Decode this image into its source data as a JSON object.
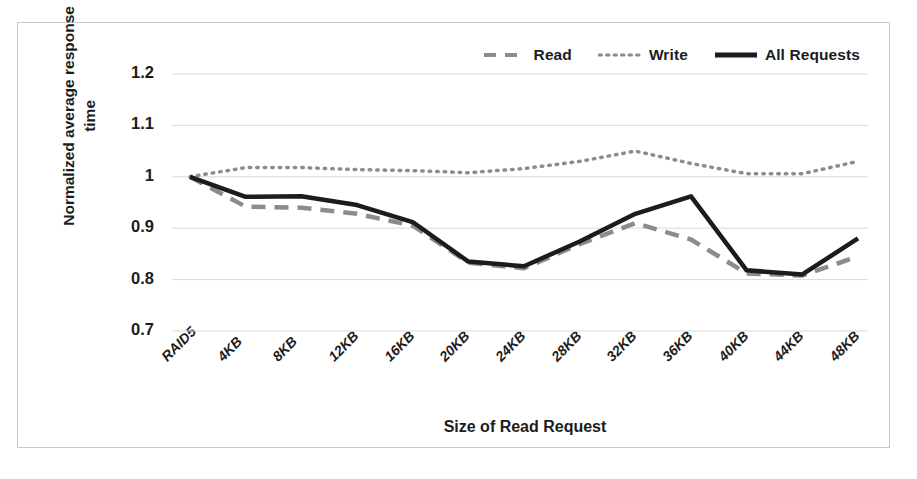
{
  "chart_data": {
    "type": "line",
    "title": "",
    "xlabel": "Size of Read Request",
    "ylabel": "Normalized average response time",
    "ylabel_line1": "Normalized average response",
    "ylabel_line2": "time",
    "categories": [
      "RAID5",
      "4KB",
      "8KB",
      "12KB",
      "16KB",
      "20KB",
      "24KB",
      "28KB",
      "32KB",
      "36KB",
      "40KB",
      "44KB",
      "48KB"
    ],
    "ylim": [
      0.7,
      1.2
    ],
    "yticks": [
      "0.7",
      "0.8",
      "0.9",
      "1",
      "1.1",
      "1.2"
    ],
    "ytick_values": [
      0.7,
      0.8,
      0.9,
      1.0,
      1.1,
      1.2
    ],
    "grid": true,
    "legend_position": "top-right",
    "series": [
      {
        "name": "Read",
        "style": "dashed",
        "color": "#8c8c8c",
        "values": [
          1.0,
          0.942,
          0.94,
          0.928,
          0.905,
          0.833,
          0.822,
          0.869,
          0.91,
          0.878,
          0.812,
          0.808,
          0.845
        ]
      },
      {
        "name": "Write",
        "style": "dotted",
        "color": "#8c8c8c",
        "values": [
          1.0,
          1.018,
          1.018,
          1.014,
          1.012,
          1.008,
          1.016,
          1.03,
          1.05,
          1.026,
          1.006,
          1.006,
          1.03
        ]
      },
      {
        "name": "All Requests",
        "style": "solid",
        "color": "#1c1c1c",
        "values": [
          1.0,
          0.961,
          0.962,
          0.945,
          0.912,
          0.835,
          0.826,
          0.874,
          0.928,
          0.962,
          0.818,
          0.81,
          0.88
        ]
      }
    ]
  },
  "legend": {
    "items": [
      {
        "label": "Read",
        "style": "dashed",
        "color": "#8c8c8c"
      },
      {
        "label": "Write",
        "style": "dotted",
        "color": "#8c8c8c"
      },
      {
        "label": "All Requests",
        "style": "solid",
        "color": "#1c1c1c"
      }
    ]
  },
  "colors": {
    "read": "#8c8c8c",
    "write": "#8c8c8c",
    "all_requests": "#1c1c1c",
    "grid": "#d9d9d9",
    "border": "#c9c9c9",
    "text": "#1c1c1c",
    "background": "#ffffff"
  }
}
